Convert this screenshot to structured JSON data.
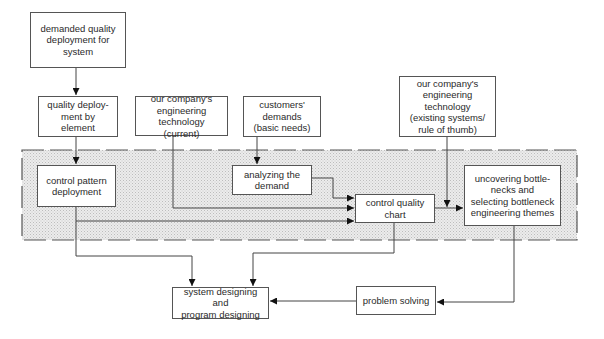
{
  "diagram": {
    "type": "flowchart",
    "region": {
      "label": "shaded dashed process region",
      "fill": "#e4e4e4",
      "border": "#555555"
    },
    "nodes": {
      "demanded_quality": {
        "label": "demanded quality\ndeployment for\nsystem"
      },
      "quality_by_element": {
        "label": "quality deploy-\nment by element"
      },
      "eng_tech_current": {
        "label": "our company's\nengineering\ntechnology (current)"
      },
      "customer_demands": {
        "label": "customers'\ndemands\n(basic needs)"
      },
      "eng_tech_existing": {
        "label": "our company's\nengineering\ntechnology\n(existing systems/\nrule of thumb)"
      },
      "control_pattern": {
        "label": "control pattern\ndeployment"
      },
      "analyzing_demand": {
        "label": "analyzing the\ndemand"
      },
      "control_quality_chart": {
        "label": "control quality\nchart"
      },
      "uncovering_bottlenecks": {
        "label": "uncovering bottle-\nnecks and\nselecting bottleneck\nengineering themes"
      },
      "system_designing": {
        "label": "system designing and\nprogram designing"
      },
      "problem_solving": {
        "label": "problem solving"
      }
    },
    "edges": [
      {
        "from": "demanded_quality",
        "to": "quality_by_element"
      },
      {
        "from": "quality_by_element",
        "to": "control_pattern"
      },
      {
        "from": "customer_demands",
        "to": "analyzing_demand"
      },
      {
        "from": "analyzing_demand",
        "to": "control_quality_chart"
      },
      {
        "from": "eng_tech_current",
        "to": "control_quality_chart"
      },
      {
        "from": "control_pattern",
        "to": "control_quality_chart"
      },
      {
        "from": "control_quality_chart",
        "to": "uncovering_bottlenecks"
      },
      {
        "from": "eng_tech_existing",
        "to": "uncovering_bottlenecks"
      },
      {
        "from": "control_pattern",
        "to": "system_designing"
      },
      {
        "from": "control_quality_chart",
        "to": "system_designing"
      },
      {
        "from": "uncovering_bottlenecks",
        "to": "problem_solving"
      },
      {
        "from": "problem_solving",
        "to": "system_designing"
      }
    ]
  }
}
